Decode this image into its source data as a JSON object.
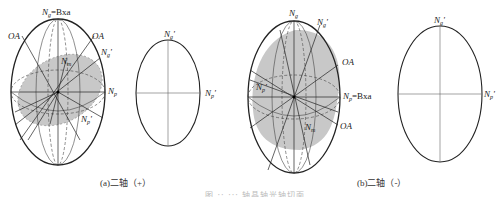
{
  "figure": {
    "panels": [
      {
        "id": "a",
        "caption": "(a)二轴（+）",
        "main_labels": {
          "top": "Ng=Bxa",
          "oa_left": "OA",
          "oa_right": "OA",
          "ng_prime": "Ng'",
          "nm": "Nm",
          "np": "Np",
          "np_prime": "Np'"
        },
        "section_labels": {
          "top": "Ng'",
          "right": "Np'"
        }
      },
      {
        "id": "b",
        "caption": "(b)二轴（-）",
        "main_labels": {
          "top": "Ng",
          "ng_prime": "Ng'",
          "oa_upper": "OA",
          "np_prime": "Np'",
          "np_bxa": "Np=Bxa",
          "nm": "Nm",
          "oa_lower": "OA"
        },
        "section_labels": {
          "top": "Ng'",
          "right": "Np'"
        }
      }
    ],
    "bottom_caption": "图 ·· ··· 轴晶轴光轴切面"
  },
  "colors": {
    "shade": "#c8c8c8",
    "line": "#222222",
    "thin_line": "#555555"
  }
}
